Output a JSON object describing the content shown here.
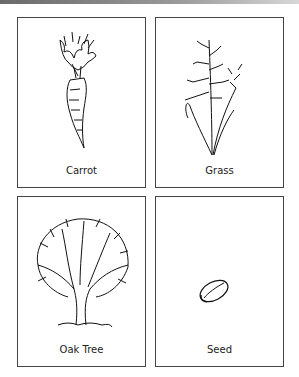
{
  "page": {
    "top_rule": true
  },
  "cards": [
    {
      "label": "Carrot",
      "icon": "carrot-illustration"
    },
    {
      "label": "Grass",
      "icon": "grass-illustration"
    },
    {
      "label": "Oak Tree",
      "icon": "oak-tree-illustration"
    },
    {
      "label": "Seed",
      "icon": "seed-illustration"
    }
  ]
}
